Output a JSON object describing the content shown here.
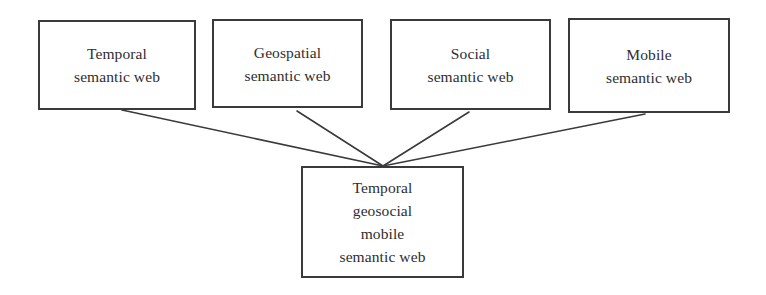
{
  "diagram": {
    "type": "convergence-diagram",
    "background_color": "#ffffff",
    "line_color": "#3a3a3c",
    "border_color": "#3a3a3c",
    "text_color": "#2e2e30",
    "source_nodes": [
      {
        "id": "temporal",
        "label": "Temporal\nsemantic web"
      },
      {
        "id": "geospatial",
        "label": "Geospatial\nsemantic web"
      },
      {
        "id": "social",
        "label": "Social\nsemantic web"
      },
      {
        "id": "mobile",
        "label": "Mobile\nsemantic web"
      }
    ],
    "target_node": {
      "id": "combined",
      "label": "Temporal\ngeosocial\nmobile\nsemantic web"
    },
    "connectors": [
      {
        "from": "temporal",
        "to": "combined",
        "x1": 122,
        "y1": 110,
        "x2": 383,
        "y2": 166
      },
      {
        "from": "geospatial",
        "to": "combined",
        "x1": 297,
        "y1": 111,
        "x2": 383,
        "y2": 166
      },
      {
        "from": "social",
        "to": "combined",
        "x1": 469,
        "y1": 112,
        "x2": 383,
        "y2": 166
      },
      {
        "from": "mobile",
        "to": "combined",
        "x1": 645,
        "y1": 114,
        "x2": 383,
        "y2": 166
      }
    ]
  }
}
